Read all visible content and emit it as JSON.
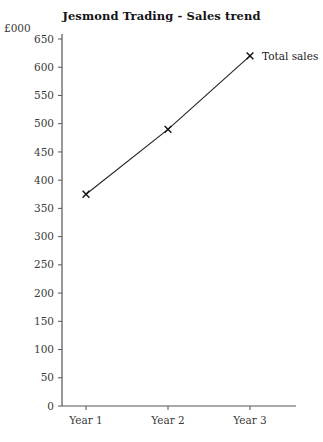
{
  "chart_data": {
    "type": "line",
    "title": "Jesmond Trading - Sales trend",
    "xlabel": "",
    "ylabel": "£000",
    "categories": [
      "Year 1",
      "Year 2",
      "Year 3"
    ],
    "series": [
      {
        "name": "Total sales",
        "values": [
          375,
          490,
          620
        ],
        "marker": "x",
        "color": "#222222"
      }
    ],
    "ylim": [
      0,
      650
    ],
    "ytick_step": 50,
    "ytick_labels": [
      "0",
      "50",
      "100",
      "150",
      "200",
      "250",
      "300",
      "350",
      "400",
      "450",
      "500",
      "550",
      "600",
      "650"
    ],
    "grid": false,
    "legend": "inline-right-of-last-point",
    "annotations": [
      {
        "text": "Total sales",
        "attached_to_category": "Year 3"
      }
    ]
  }
}
